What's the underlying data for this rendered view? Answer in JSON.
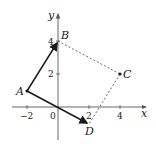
{
  "diagram": {
    "type": "coordinate-plane-quadrilateral",
    "axes": {
      "x_label": "x",
      "y_label": "y",
      "origin_label": "0",
      "x_ticks": [
        "−2",
        "2",
        "4"
      ],
      "y_ticks": [
        "2",
        "4"
      ]
    },
    "points": [
      {
        "name": "A",
        "x": -2,
        "y": 1
      },
      {
        "name": "B",
        "x": 0,
        "y": 4
      },
      {
        "name": "C",
        "x": 4,
        "y": 2
      },
      {
        "name": "D",
        "x": 2,
        "y": -1
      }
    ],
    "vectors": [
      {
        "from": "A",
        "to": "B",
        "style": "solid-arrow"
      },
      {
        "from": "A",
        "to": "D",
        "style": "solid-arrow"
      }
    ],
    "dashed_segments": [
      {
        "from": "B",
        "to": "C"
      },
      {
        "from": "C",
        "to": "D"
      }
    ],
    "colors": {
      "line": "#1a1a1a",
      "axis": "#555555",
      "dashed": "#444444"
    }
  }
}
